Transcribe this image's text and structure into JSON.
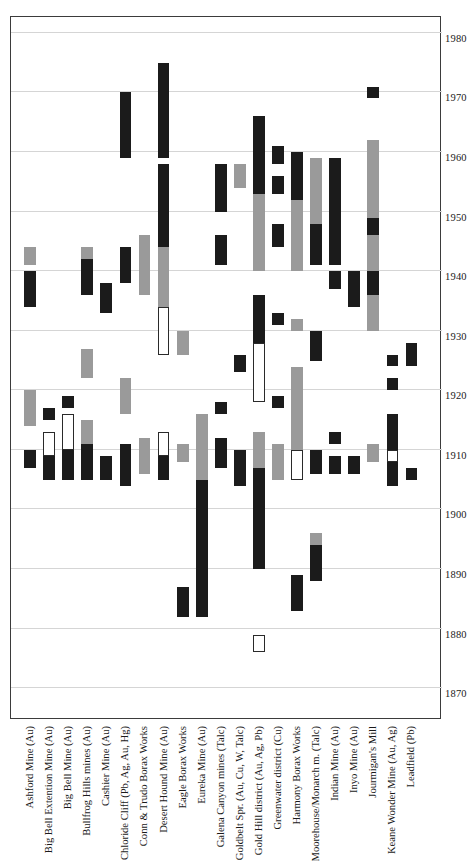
{
  "figure": {
    "title": "",
    "orientation": "rotated-90-ccw",
    "frame_color": "#3b3b3b",
    "grid_color": "#d5d5d5",
    "colors": {
      "black": "#1b1b1b",
      "gray": "#9a9a9a",
      "white": "#ffffff"
    }
  },
  "chart_data": {
    "type": "bar",
    "subtype": "gantt-timeline",
    "title": "",
    "xlabel": "",
    "ylabel": "",
    "xlim": [
      1865,
      1983
    ],
    "ylim": [
      1865,
      1983
    ],
    "grid": true,
    "legend": "none",
    "time_axis": {
      "ticks": [
        1870,
        1880,
        1890,
        1900,
        1910,
        1920,
        1930,
        1940,
        1950,
        1960,
        1970,
        1980
      ],
      "min": 1865,
      "max": 1983
    },
    "categories": [
      "Ashford Mine (Au)",
      "Big Bell Extention Mine (Au)",
      "Big Bell Mine (Au)",
      "Bullfrog Hills mines (Au)",
      "Cashier Mine (Au)",
      "Chloride Cliff (Pb, Ag, Au, Hg)",
      "Conn & Trudo Borax Works",
      "Desert Hound Mine (Au)",
      "Eagle Borax Works",
      "Eureka Mine (Au)",
      "Galena Canyon mines (Talc)",
      "Goldbelt Spr. (Au, Cu, W, Talc)",
      "Gold Hill district (Au, Ag, Pb)",
      "Greenwater district (Cu)",
      "Harmony Borax Works",
      "Moorehouse/Monarch m. (Talc)",
      "Indian Mine (Au)",
      "Inyo Mine (Au)",
      "Jourmigan's Mill",
      "Keane Wonder Mine (Au, Ag)",
      "Leadfield (Pb)"
    ],
    "series": [
      {
        "category": "Ashford Mine (Au)",
        "spans": [
          {
            "start": 1907,
            "end": 1910,
            "fill": "black"
          },
          {
            "start": 1914,
            "end": 1920,
            "fill": "gray"
          },
          {
            "start": 1934,
            "end": 1940,
            "fill": "black"
          },
          {
            "start": 1941,
            "end": 1944,
            "fill": "gray"
          }
        ]
      },
      {
        "category": "Big Bell Extention Mine (Au)",
        "spans": [
          {
            "start": 1905,
            "end": 1909,
            "fill": "black"
          },
          {
            "start": 1909,
            "end": 1913,
            "fill": "white"
          },
          {
            "start": 1915,
            "end": 1917,
            "fill": "black"
          }
        ]
      },
      {
        "category": "Big Bell Mine (Au)",
        "spans": [
          {
            "start": 1905,
            "end": 1910,
            "fill": "black"
          },
          {
            "start": 1910,
            "end": 1916,
            "fill": "white"
          },
          {
            "start": 1917,
            "end": 1919,
            "fill": "black"
          }
        ]
      },
      {
        "category": "Bullfrog Hills mines (Au)",
        "spans": [
          {
            "start": 1905,
            "end": 1911,
            "fill": "black"
          },
          {
            "start": 1911,
            "end": 1915,
            "fill": "gray"
          },
          {
            "start": 1922,
            "end": 1927,
            "fill": "gray"
          },
          {
            "start": 1936,
            "end": 1942,
            "fill": "black"
          },
          {
            "start": 1942,
            "end": 1944,
            "fill": "gray"
          }
        ]
      },
      {
        "category": "Cashier Mine (Au)",
        "spans": [
          {
            "start": 1905,
            "end": 1909,
            "fill": "black"
          },
          {
            "start": 1933,
            "end": 1938,
            "fill": "black"
          }
        ]
      },
      {
        "category": "Chloride Cliff (Pb, Ag, Au, Hg)",
        "spans": [
          {
            "start": 1904,
            "end": 1911,
            "fill": "black"
          },
          {
            "start": 1916,
            "end": 1922,
            "fill": "gray"
          },
          {
            "start": 1938,
            "end": 1944,
            "fill": "black"
          },
          {
            "start": 1959,
            "end": 1970,
            "fill": "black"
          }
        ]
      },
      {
        "category": "Conn & Trudo Borax Works",
        "spans": [
          {
            "start": 1906,
            "end": 1912,
            "fill": "gray"
          },
          {
            "start": 1936,
            "end": 1946,
            "fill": "gray"
          }
        ]
      },
      {
        "category": "Desert Hound Mine (Au)",
        "spans": [
          {
            "start": 1905,
            "end": 1909,
            "fill": "black"
          },
          {
            "start": 1909,
            "end": 1913,
            "fill": "white"
          },
          {
            "start": 1926,
            "end": 1934,
            "fill": "white"
          },
          {
            "start": 1934,
            "end": 1944,
            "fill": "gray"
          },
          {
            "start": 1944,
            "end": 1958,
            "fill": "black"
          },
          {
            "start": 1959,
            "end": 1975,
            "fill": "black"
          }
        ]
      },
      {
        "category": "Eagle Borax Works",
        "spans": [
          {
            "start": 1882,
            "end": 1887,
            "fill": "black"
          },
          {
            "start": 1908,
            "end": 1911,
            "fill": "gray"
          },
          {
            "start": 1926,
            "end": 1930,
            "fill": "gray"
          }
        ]
      },
      {
        "category": "Eureka Mine (Au)",
        "spans": [
          {
            "start": 1882,
            "end": 1889,
            "fill": "black"
          },
          {
            "start": 1889,
            "end": 1905,
            "fill": "black"
          },
          {
            "start": 1905,
            "end": 1913,
            "fill": "gray"
          },
          {
            "start": 1913,
            "end": 1916,
            "fill": "gray"
          }
        ]
      },
      {
        "category": "Galena Canyon mines (Talc)",
        "spans": [
          {
            "start": 1907,
            "end": 1912,
            "fill": "black"
          },
          {
            "start": 1916,
            "end": 1918,
            "fill": "black"
          },
          {
            "start": 1941,
            "end": 1946,
            "fill": "black"
          },
          {
            "start": 1950,
            "end": 1958,
            "fill": "black"
          }
        ]
      },
      {
        "category": "Goldbelt Spr. (Au, Cu, W, Talc)",
        "spans": [
          {
            "start": 1904,
            "end": 1910,
            "fill": "black"
          },
          {
            "start": 1923,
            "end": 1926,
            "fill": "black"
          },
          {
            "start": 1954,
            "end": 1958,
            "fill": "gray"
          }
        ]
      },
      {
        "category": "Gold Hill district (Au, Ag, Pb)",
        "spans": [
          {
            "start": 1876,
            "end": 1879,
            "fill": "white"
          },
          {
            "start": 1890,
            "end": 1907,
            "fill": "black"
          },
          {
            "start": 1907,
            "end": 1913,
            "fill": "gray"
          },
          {
            "start": 1918,
            "end": 1928,
            "fill": "white"
          },
          {
            "start": 1928,
            "end": 1936,
            "fill": "black"
          },
          {
            "start": 1940,
            "end": 1953,
            "fill": "gray"
          },
          {
            "start": 1953,
            "end": 1966,
            "fill": "black"
          }
        ]
      },
      {
        "category": "Greenwater district (Cu)",
        "spans": [
          {
            "start": 1905,
            "end": 1911,
            "fill": "gray"
          },
          {
            "start": 1917,
            "end": 1919,
            "fill": "black"
          },
          {
            "start": 1931,
            "end": 1933,
            "fill": "black"
          },
          {
            "start": 1944,
            "end": 1948,
            "fill": "black"
          },
          {
            "start": 1953,
            "end": 1956,
            "fill": "black"
          },
          {
            "start": 1958,
            "end": 1961,
            "fill": "black"
          }
        ]
      },
      {
        "category": "Harmony Borax Works",
        "spans": [
          {
            "start": 1883,
            "end": 1889,
            "fill": "black"
          },
          {
            "start": 1905,
            "end": 1910,
            "fill": "white"
          },
          {
            "start": 1910,
            "end": 1924,
            "fill": "gray"
          },
          {
            "start": 1930,
            "end": 1932,
            "fill": "gray"
          },
          {
            "start": 1940,
            "end": 1952,
            "fill": "gray"
          },
          {
            "start": 1952,
            "end": 1960,
            "fill": "black"
          }
        ]
      },
      {
        "category": "Moorehouse/Monarch m. (Talc)",
        "spans": [
          {
            "start": 1888,
            "end": 1894,
            "fill": "black"
          },
          {
            "start": 1894,
            "end": 1896,
            "fill": "gray"
          },
          {
            "start": 1906,
            "end": 1910,
            "fill": "black"
          },
          {
            "start": 1925,
            "end": 1930,
            "fill": "black"
          },
          {
            "start": 1941,
            "end": 1948,
            "fill": "black"
          },
          {
            "start": 1948,
            "end": 1959,
            "fill": "gray"
          }
        ]
      },
      {
        "category": "Indian Mine (Au)",
        "spans": [
          {
            "start": 1906,
            "end": 1909,
            "fill": "black"
          },
          {
            "start": 1911,
            "end": 1913,
            "fill": "black"
          },
          {
            "start": 1937,
            "end": 1940,
            "fill": "black"
          },
          {
            "start": 1941,
            "end": 1959,
            "fill": "black"
          }
        ]
      },
      {
        "category": "Inyo Mine (Au)",
        "spans": [
          {
            "start": 1906,
            "end": 1909,
            "fill": "black"
          },
          {
            "start": 1934,
            "end": 1940,
            "fill": "black"
          }
        ]
      },
      {
        "category": "Jourmigan's Mill",
        "spans": [
          {
            "start": 1908,
            "end": 1911,
            "fill": "gray"
          },
          {
            "start": 1930,
            "end": 1936,
            "fill": "gray"
          },
          {
            "start": 1936,
            "end": 1940,
            "fill": "black"
          },
          {
            "start": 1940,
            "end": 1946,
            "fill": "gray"
          },
          {
            "start": 1946,
            "end": 1949,
            "fill": "black"
          },
          {
            "start": 1949,
            "end": 1962,
            "fill": "gray"
          },
          {
            "start": 1969,
            "end": 1971,
            "fill": "black"
          }
        ]
      },
      {
        "category": "Keane Wonder Mine (Au, Ag)",
        "spans": [
          {
            "start": 1904,
            "end": 1906,
            "fill": "black"
          },
          {
            "start": 1906,
            "end": 1908,
            "fill": "black"
          },
          {
            "start": 1908,
            "end": 1910,
            "fill": "white"
          },
          {
            "start": 1910,
            "end": 1916,
            "fill": "black"
          },
          {
            "start": 1920,
            "end": 1922,
            "fill": "black"
          },
          {
            "start": 1924,
            "end": 1926,
            "fill": "black"
          }
        ]
      },
      {
        "category": "Leadfield (Pb)",
        "spans": [
          {
            "start": 1905,
            "end": 1907,
            "fill": "black"
          },
          {
            "start": 1924,
            "end": 1928,
            "fill": "black"
          }
        ]
      }
    ]
  }
}
